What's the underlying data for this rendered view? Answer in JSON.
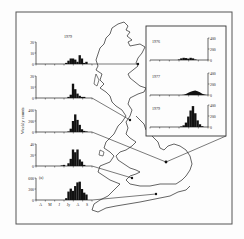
{
  "figure": {
    "frame_color": "#555555",
    "ink_color": "#111111",
    "panel_label": "(a)",
    "y_axis_label": "Weekly counts",
    "x_tick_labels": [
      "A",
      "M",
      "J",
      "Jy",
      "A",
      "S"
    ]
  },
  "chart_data": [
    {
      "type": "bar",
      "title": "1979",
      "ylabel": "Weekly counts",
      "y_ticks": [
        0,
        10,
        20
      ],
      "ylim": [
        0,
        20
      ],
      "x": [
        0,
        1,
        2,
        3,
        4,
        5,
        6,
        7,
        8,
        9,
        10,
        11,
        12,
        13,
        14,
        15,
        16,
        17,
        18,
        19,
        20,
        21,
        22,
        23,
        24
      ],
      "values": [
        0,
        0,
        0,
        0,
        0,
        0,
        0,
        0,
        0,
        0,
        0,
        0,
        0,
        1,
        3,
        5,
        5,
        4,
        2,
        8,
        5,
        1,
        2,
        0,
        0
      ]
    },
    {
      "type": "bar",
      "title": "",
      "ylabel": "Weekly counts",
      "y_ticks": [
        0,
        10,
        20
      ],
      "ylim": [
        0,
        20
      ],
      "values": [
        0,
        0,
        0,
        0,
        0,
        0,
        0,
        0,
        0,
        0,
        0,
        0,
        0,
        0,
        1,
        3,
        13,
        8,
        4,
        2,
        1,
        1,
        0,
        0,
        0
      ]
    },
    {
      "type": "bar",
      "title": "",
      "ylabel": "Weekly counts",
      "y_ticks": [
        0,
        200,
        400
      ],
      "ylim": [
        0,
        400
      ],
      "values": [
        0,
        0,
        0,
        0,
        0,
        0,
        0,
        0,
        0,
        0,
        0,
        0,
        0,
        0,
        10,
        60,
        200,
        320,
        220,
        130,
        50,
        20,
        10,
        0,
        0
      ]
    },
    {
      "type": "bar",
      "title": "",
      "ylabel": "Weekly counts",
      "y_ticks": [
        0,
        20,
        40
      ],
      "ylim": [
        0,
        40
      ],
      "values": [
        0,
        0,
        0,
        0,
        0,
        0,
        0,
        0,
        0,
        0,
        0,
        1,
        2,
        0,
        5,
        13,
        30,
        25,
        30,
        12,
        8,
        2,
        0,
        0,
        0
      ]
    },
    {
      "type": "bar",
      "title": "(a)",
      "ylabel": "Weekly counts",
      "y_ticks": [
        0,
        300,
        600
      ],
      "ylim": [
        0,
        600
      ],
      "categories": [
        "A",
        "M",
        "J",
        "Jy",
        "A",
        "S"
      ],
      "values": [
        0,
        0,
        0,
        0,
        0,
        0,
        0,
        0,
        0,
        0,
        0,
        0,
        0,
        50,
        230,
        310,
        250,
        380,
        480,
        500,
        300,
        200,
        150,
        0,
        0
      ]
    },
    {
      "type": "bar",
      "title": "1976",
      "y_ticks": [
        0,
        200,
        400
      ],
      "ylim": [
        0,
        400
      ],
      "axis_side": "right",
      "values": [
        0,
        0,
        0,
        0,
        0,
        0,
        0,
        0,
        0,
        0,
        0,
        0,
        10,
        30,
        40,
        35,
        25,
        40,
        30,
        10,
        0,
        0,
        0,
        0,
        0
      ]
    },
    {
      "type": "area",
      "title": "1977",
      "y_ticks": [
        0,
        200,
        400
      ],
      "ylim": [
        0,
        400
      ],
      "axis_side": "right",
      "values": [
        0,
        0,
        0,
        0,
        0,
        0,
        0,
        0,
        0,
        0,
        0,
        0,
        0,
        0,
        5,
        20,
        40,
        60,
        75,
        80,
        70,
        50,
        25,
        10,
        0
      ]
    },
    {
      "type": "bar",
      "title": "1979",
      "y_ticks": [
        0,
        200,
        400
      ],
      "ylim": [
        0,
        400
      ],
      "axis_side": "right",
      "values": [
        0,
        0,
        0,
        0,
        0,
        0,
        0,
        0,
        0,
        0,
        0,
        0,
        0,
        10,
        30,
        80,
        190,
        300,
        380,
        250,
        120,
        50,
        15,
        0,
        0
      ]
    }
  ]
}
